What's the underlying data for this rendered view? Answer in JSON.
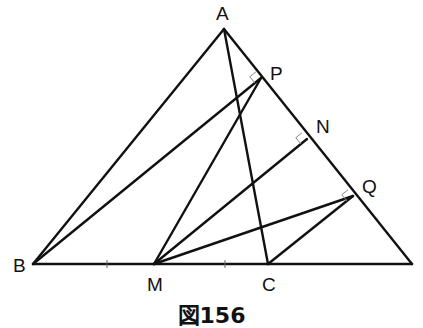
{
  "figure": {
    "caption": "図156",
    "points": {
      "A": {
        "label": "A",
        "x": 224,
        "y": 29
      },
      "B": {
        "label": "B",
        "x": 33,
        "y": 264
      },
      "R": {
        "label": "",
        "x": 412,
        "y": 264
      },
      "M": {
        "label": "M",
        "x": 154,
        "y": 264
      },
      "C": {
        "label": "C",
        "x": 268,
        "y": 264
      },
      "P": {
        "label": "P",
        "x": 261,
        "y": 78
      },
      "N": {
        "label": "N",
        "x": 307,
        "y": 139
      },
      "Q": {
        "label": "Q",
        "x": 353,
        "y": 196
      }
    },
    "segments": [
      [
        "A",
        "B"
      ],
      [
        "A",
        "R"
      ],
      [
        "B",
        "R"
      ],
      [
        "A",
        "C"
      ],
      [
        "B",
        "P"
      ],
      [
        "M",
        "P"
      ],
      [
        "M",
        "N"
      ],
      [
        "M",
        "Q"
      ],
      [
        "C",
        "Q"
      ]
    ],
    "right_angle_marks": [
      "P",
      "N",
      "Q"
    ],
    "tick_marks": [
      {
        "x": 107,
        "y": 264
      },
      {
        "x": 225,
        "y": 264
      }
    ],
    "colors": {
      "line": "#111111",
      "right_angle_mark": "#8a8a8a",
      "background": "#ffffff"
    }
  }
}
